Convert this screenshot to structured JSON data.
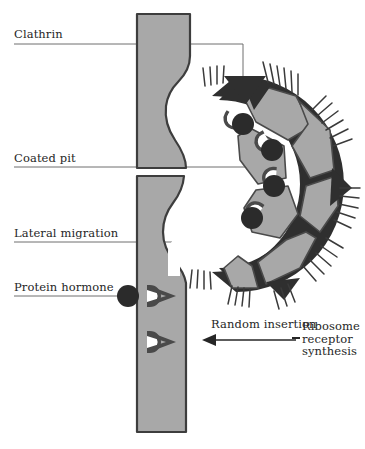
{
  "figure": {
    "background_color": "#ffffff"
  },
  "labels": {
    "clathrin": "Clathrin",
    "coated_pit": "Coated pit",
    "lateral_migration": "Lateral migration",
    "protein_hormone": "Protein hormone",
    "random_insertion": "Random insertion",
    "ribosome_line1": "Ribosome",
    "ribosome_line2": "receptor",
    "ribosome_line3": "synthesis"
  },
  "colors": {
    "membrane_fill": "#a8a8a8",
    "membrane_outline": "#3d3d3d",
    "clathrin_plate_fill": "#a8a8a8",
    "clathrin_wedge_dark": "#2f2f2f",
    "receptor_rim": "#4a4a4a",
    "receptor_socket_white": "#ffffff",
    "hormone_fill": "#2b2b2b",
    "bristle": "#3a3a3a",
    "arrow_white": "#ffffff",
    "leader_line": "#6e6e6e",
    "text": "#262626",
    "page_background": "#ffffff"
  },
  "elements": {
    "membrane_column_label": "plasma membrane lipid bilayer",
    "coated_pit_label": "invaginating coated pit",
    "clathrin_coat_label": "clathrin lattice coat",
    "bound_receptor_count": 4,
    "empty_receptor_count": 2,
    "free_hormone_count": 1,
    "migration_arrow_label": "curved lateral migration arrow",
    "insertion_arrow_label": "leftward random insertion arrow"
  }
}
